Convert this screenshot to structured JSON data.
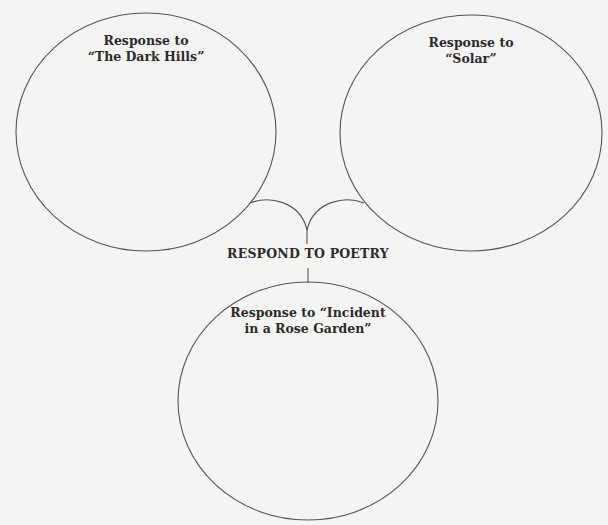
{
  "diagram": {
    "type": "web-organizer",
    "center": {
      "title": "RESPOND TO POETRY"
    },
    "nodes": [
      {
        "id": "left",
        "line1": "Response to",
        "line2": "“The Dark Hills”",
        "content": ""
      },
      {
        "id": "right",
        "line1": "Response to",
        "line2": "“Solar”",
        "content": ""
      },
      {
        "id": "bottom",
        "line1": "Response to “Incident",
        "line2": "in a Rose Garden”",
        "content": ""
      }
    ],
    "colors": {
      "background": "#f4f4f2",
      "stroke": "#555555",
      "text": "#2b2b2b"
    }
  }
}
